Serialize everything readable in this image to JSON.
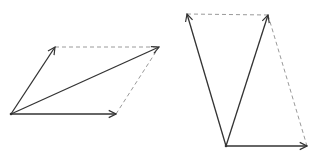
{
  "diagrams": [
    {
      "name": "parallelogram-vector-addition",
      "origin": [
        11,
        114
      ],
      "vectors": [
        {
          "name": "vector-a",
          "from": [
            11,
            114
          ],
          "to": [
            55,
            47
          ],
          "style": "solid"
        },
        {
          "name": "vector-b",
          "from": [
            11,
            114
          ],
          "to": [
            116,
            114
          ],
          "style": "solid"
        },
        {
          "name": "vector-sum",
          "from": [
            11,
            114
          ],
          "to": [
            159,
            47
          ],
          "style": "solid"
        }
      ],
      "guides": [
        {
          "name": "guide-top",
          "from": [
            55,
            47
          ],
          "to": [
            159,
            47
          ],
          "style": "dashed"
        },
        {
          "name": "guide-right",
          "from": [
            116,
            114
          ],
          "to": [
            159,
            47
          ],
          "style": "dashed"
        }
      ]
    },
    {
      "name": "parallelogram-vector-difference",
      "origin": [
        226,
        146
      ],
      "vectors": [
        {
          "name": "vector-c",
          "from": [
            226,
            146
          ],
          "to": [
            187,
            14
          ],
          "style": "solid"
        },
        {
          "name": "vector-d",
          "from": [
            226,
            146
          ],
          "to": [
            268,
            15
          ],
          "style": "solid"
        },
        {
          "name": "vector-e",
          "from": [
            226,
            146
          ],
          "to": [
            307,
            146
          ],
          "style": "solid"
        }
      ],
      "guides": [
        {
          "name": "guide-top",
          "from": [
            187,
            14
          ],
          "to": [
            268,
            15
          ],
          "style": "dashed"
        },
        {
          "name": "guide-right",
          "from": [
            268,
            15
          ],
          "to": [
            307,
            146
          ],
          "style": "dashed"
        }
      ]
    }
  ],
  "colors": {
    "solid": "#333333",
    "dashed": "#9a9a9a",
    "background": "#ffffff"
  }
}
